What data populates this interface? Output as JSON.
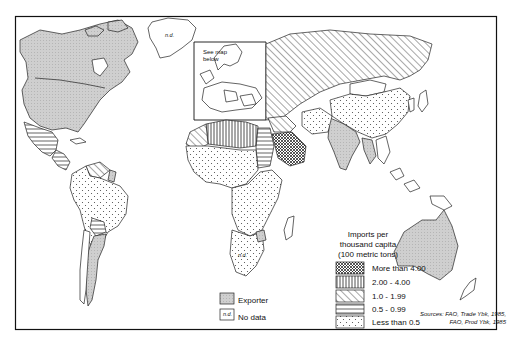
{
  "map": {
    "inset_label": [
      "See map",
      "below"
    ],
    "nd_marker": "n.d.",
    "legend": {
      "title": [
        "Imports per",
        "thousand capita",
        "(100 metric tons)"
      ],
      "classes": [
        {
          "label": "More than 4.00",
          "pattern": "crosshatch"
        },
        {
          "label": "2.00 - 4.00",
          "pattern": "vertical-lines"
        },
        {
          "label": "1.0 - 1.99",
          "pattern": "diagonal-lines"
        },
        {
          "label": "0.5 - 0.99",
          "pattern": "horizontal-lines"
        },
        {
          "label": "Less than 0.5",
          "pattern": "dots"
        }
      ],
      "exporter": {
        "label": "Exporter",
        "pattern": "gray-fill"
      },
      "no_data": {
        "label": "No data",
        "swatch_text": "n.d."
      }
    },
    "sources": [
      "Sources: FAO, Trade Ybk, 1985,",
      "FAO, Prod Ybk, 1985"
    ],
    "colors": {
      "frame": "#111111",
      "exporter_fill": "#c8c8c8",
      "land_outline": "#222222",
      "background": "#ffffff"
    }
  }
}
